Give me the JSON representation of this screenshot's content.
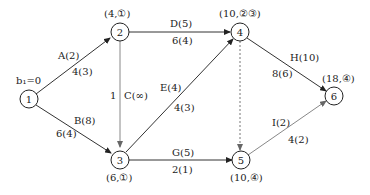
{
  "diagram": {
    "type": "network-flow",
    "start_label": "b₁=0",
    "nodes": [
      {
        "id": "1",
        "label": "1",
        "annotation": ""
      },
      {
        "id": "2",
        "label": "2",
        "annotation": "(4,①)"
      },
      {
        "id": "3",
        "label": "3",
        "annotation": "(6,①)"
      },
      {
        "id": "4",
        "label": "4",
        "annotation": "(10,②③)"
      },
      {
        "id": "5",
        "label": "5",
        "annotation": "(10,④)"
      },
      {
        "id": "6",
        "label": "6",
        "annotation": "(18,④)"
      }
    ],
    "edges": [
      {
        "from": "1",
        "to": "2",
        "name": "A(2)",
        "flow": "4(3)"
      },
      {
        "from": "1",
        "to": "3",
        "name": "B(8)",
        "flow": "6(4)"
      },
      {
        "from": "2",
        "to": "3",
        "name": "C(∞)",
        "flow": "1"
      },
      {
        "from": "2",
        "to": "4",
        "name": "D(5)",
        "flow": "6(4)"
      },
      {
        "from": "3",
        "to": "4",
        "name": "E(4)",
        "flow": "4(3)"
      },
      {
        "from": "3",
        "to": "5",
        "name": "G(5)",
        "flow": "2(1)"
      },
      {
        "from": "4",
        "to": "5",
        "name": "",
        "flow": "",
        "style": "dashed"
      },
      {
        "from": "4",
        "to": "6",
        "name": "H(10)",
        "flow": "8(6)"
      },
      {
        "from": "5",
        "to": "6",
        "name": "I(2)",
        "flow": "4(2)"
      }
    ]
  }
}
